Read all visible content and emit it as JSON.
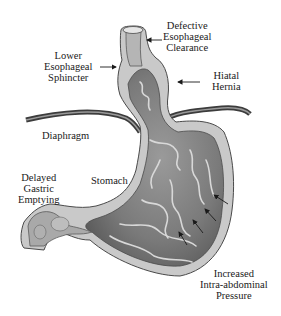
{
  "diagram": {
    "colors": {
      "wall_outer": "#c9c9c9",
      "wall_line": "#4a4a4a",
      "mucosa_dark": "#5e5e5e",
      "mucosa_mid": "#8a8a8a",
      "rugae_light": "#d8d8d8",
      "diaphragm": "#3c3c3c",
      "diaphragm_light": "#9a9a9a",
      "text": "#1a1a1a"
    },
    "labels": {
      "defective_clearance": [
        "Defective",
        "Esophageal",
        "Clearance"
      ],
      "lower_sphincter": [
        "Lower",
        "Esophageal",
        "Sphincter"
      ],
      "hiatal_hernia": [
        "Hiatal",
        "Hernia"
      ],
      "diaphragm": [
        "Diaphragm"
      ],
      "stomach": [
        "Stomach"
      ],
      "delayed_emptying": [
        "Delayed",
        "Gastric",
        "Emptying"
      ],
      "intra_abdominal": [
        "Increased",
        "Intra-abdominal",
        "Pressure"
      ]
    },
    "arrows": {
      "defective_clearance": "left",
      "lower_sphincter": "right",
      "hiatal_hernia": "left",
      "pressure_arrows_count": 4
    }
  }
}
